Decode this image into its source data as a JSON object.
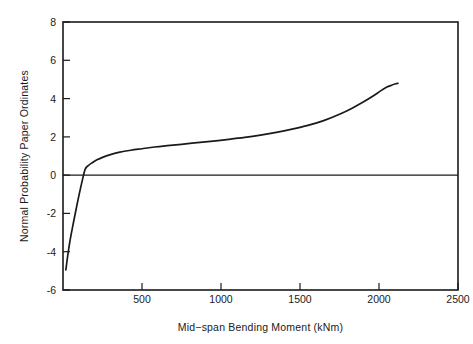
{
  "chart_data": {
    "type": "line",
    "title": "",
    "xlabel": "Mid−span Bending Moment (kNm)",
    "ylabel": "Normal Probability Paper Ordinates",
    "xlim": [
      0,
      2500
    ],
    "ylim": [
      -6,
      8
    ],
    "xticks": [
      0,
      500,
      1000,
      1500,
      2000,
      2500
    ],
    "xticklabels": [
      "",
      "500",
      "1000",
      "1500",
      "2000",
      "2500"
    ],
    "yticks": [
      -6,
      -4,
      -2,
      0,
      2,
      4,
      6,
      8
    ],
    "yticklabels": [
      "-6",
      "-4",
      "-2",
      "0",
      "2",
      "4",
      "6",
      "8"
    ],
    "grid": false,
    "legend": null,
    "reference_lines": [
      {
        "orientation": "horizontal",
        "value": 0
      }
    ],
    "series": [
      {
        "name": "Mid-span bending moment distribution",
        "x": [
          18,
          22,
          30,
          45,
          62,
          80,
          100,
          120,
          140,
          160,
          185,
          215,
          250,
          300,
          360,
          430,
          500,
          580,
          660,
          750,
          850,
          950,
          1050,
          1150,
          1250,
          1350,
          1450,
          1550,
          1650,
          1750,
          1830,
          1900,
          1960,
          2010,
          2050,
          2080,
          2100,
          2120
        ],
        "y": [
          -4.95,
          -4.7,
          -4.2,
          -3.4,
          -2.65,
          -1.9,
          -1.1,
          -0.35,
          0.3,
          0.5,
          0.65,
          0.8,
          0.93,
          1.07,
          1.2,
          1.3,
          1.38,
          1.47,
          1.54,
          1.61,
          1.7,
          1.78,
          1.87,
          1.97,
          2.09,
          2.23,
          2.4,
          2.6,
          2.85,
          3.18,
          3.5,
          3.82,
          4.12,
          4.4,
          4.6,
          4.7,
          4.76,
          4.8
        ]
      }
    ]
  },
  "axes": {
    "x_axis_label": "Mid−span Bending Moment (kNm)",
    "y_axis_label": "Normal Probability Paper Ordinates"
  },
  "x_tick_labels": [
    "500",
    "1000",
    "1500",
    "2000",
    "2500"
  ],
  "y_tick_labels": [
    "8",
    "6",
    "4",
    "2",
    "0",
    "-2",
    "-4",
    "-6"
  ]
}
